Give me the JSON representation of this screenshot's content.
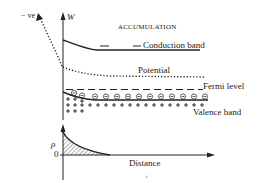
{
  "diagram": {
    "title": "ACCUMULATION",
    "top_panel": {
      "y_axis_label": "W",
      "potential_axis_label": "− ve",
      "curves": [
        {
          "name": "Conduction band",
          "style": "solid"
        },
        {
          "name": "Potential",
          "style": "dotted"
        },
        {
          "name": "Fermi level",
          "style": "dashed"
        },
        {
          "name": "Valence band",
          "style": "solid"
        }
      ],
      "electron_symbol": "⊖",
      "hole_symbol": "+"
    },
    "bottom_panel": {
      "y_axis_label": "ρ",
      "zero_label": "0",
      "x_axis_label": "Distance"
    },
    "footnote_mark": "i",
    "colors": {
      "ink": "#222222",
      "background": "#ffffff"
    }
  }
}
